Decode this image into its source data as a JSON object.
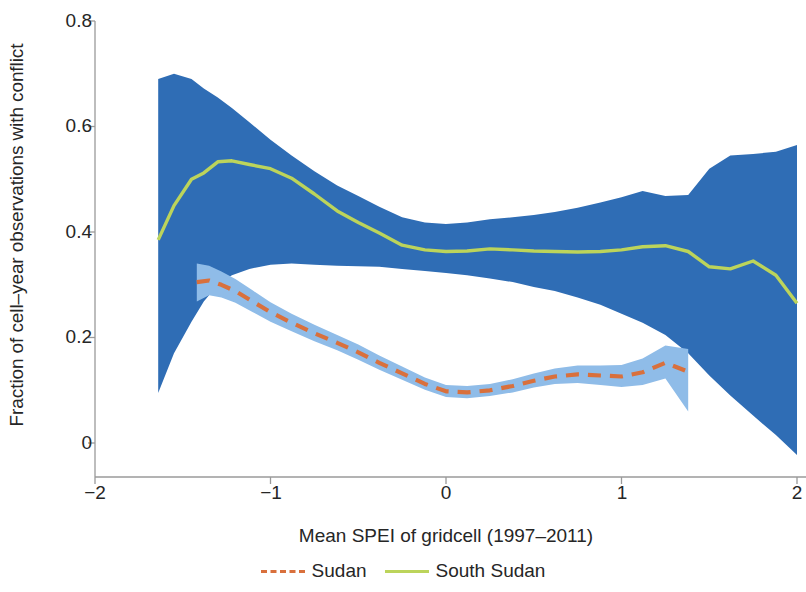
{
  "axes": {
    "ylabel": "Fraction of cell–year observations with conflict",
    "xlabel": "Mean SPEI of gridcell (1997–2011)",
    "y_ticks": [
      "0.8",
      "0.6",
      "0.4",
      "0.2",
      "0"
    ],
    "x_ticks": [
      "−2",
      "−1",
      "0",
      "1",
      "2"
    ]
  },
  "legend": {
    "items": [
      {
        "label": "Sudan",
        "color": "#D9703C",
        "style": "dashed"
      },
      {
        "label": "South Sudan",
        "color": "#BCD45B",
        "style": "solid"
      }
    ]
  },
  "colors": {
    "sudan_line": "#D9703C",
    "sudan_band": "#8FBCE8",
    "south_sudan_line": "#BCD45B",
    "south_sudan_band": "#2F6DB5",
    "axis": "#9a9a9a",
    "text": "#262626"
  },
  "chart_data": {
    "type": "line",
    "title": "",
    "xlabel": "Mean SPEI of gridcell (1997–2011)",
    "ylabel": "Fraction of cell–year observations with conflict",
    "xlim": [
      -2,
      2
    ],
    "ylim": [
      -0.06,
      0.8
    ],
    "grid": false,
    "legend_position": "bottom",
    "x_ticks": [
      -2,
      -1,
      0,
      1,
      2
    ],
    "y_ticks": [
      0,
      0.2,
      0.4,
      0.6,
      0.8
    ],
    "series": [
      {
        "name": "South Sudan",
        "color": "#BCD45B",
        "linestyle": "solid",
        "band_color": "#2F6DB5",
        "x": [
          -1.64,
          -1.55,
          -1.45,
          -1.38,
          -1.3,
          -1.22,
          -1.12,
          -1.0,
          -0.88,
          -0.75,
          -0.62,
          -0.5,
          -0.38,
          -0.25,
          -0.12,
          0.0,
          0.12,
          0.25,
          0.38,
          0.5,
          0.62,
          0.75,
          0.88,
          1.0,
          1.12,
          1.25,
          1.38,
          1.5,
          1.62,
          1.75,
          1.88,
          2.0
        ],
        "y": [
          0.385,
          0.45,
          0.5,
          0.512,
          0.533,
          0.535,
          0.528,
          0.52,
          0.502,
          0.472,
          0.44,
          0.418,
          0.398,
          0.375,
          0.366,
          0.363,
          0.364,
          0.368,
          0.366,
          0.364,
          0.363,
          0.362,
          0.363,
          0.366,
          0.372,
          0.374,
          0.363,
          0.334,
          0.33,
          0.345,
          0.318,
          0.265
        ],
        "y_lower": [
          0.095,
          0.17,
          0.23,
          0.268,
          0.3,
          0.318,
          0.33,
          0.338,
          0.34,
          0.338,
          0.336,
          0.335,
          0.334,
          0.33,
          0.326,
          0.322,
          0.318,
          0.312,
          0.305,
          0.296,
          0.288,
          0.276,
          0.262,
          0.245,
          0.228,
          0.205,
          0.17,
          0.128,
          0.09,
          0.052,
          0.015,
          -0.023
        ],
        "y_upper": [
          0.69,
          0.7,
          0.69,
          0.672,
          0.655,
          0.635,
          0.608,
          0.575,
          0.545,
          0.515,
          0.488,
          0.468,
          0.448,
          0.428,
          0.418,
          0.415,
          0.418,
          0.424,
          0.428,
          0.432,
          0.438,
          0.446,
          0.456,
          0.466,
          0.478,
          0.468,
          0.47,
          0.52,
          0.545,
          0.548,
          0.552,
          0.565
        ]
      },
      {
        "name": "Sudan",
        "color": "#D9703C",
        "linestyle": "dashed",
        "band_color": "#8FBCE8",
        "x": [
          -1.42,
          -1.35,
          -1.28,
          -1.2,
          -1.1,
          -1.0,
          -0.88,
          -0.75,
          -0.62,
          -0.5,
          -0.38,
          -0.25,
          -0.12,
          0.0,
          0.12,
          0.25,
          0.38,
          0.5,
          0.62,
          0.75,
          0.88,
          1.0,
          1.12,
          1.25,
          1.38
        ],
        "y": [
          0.305,
          0.308,
          0.3,
          0.288,
          0.268,
          0.248,
          0.228,
          0.208,
          0.19,
          0.172,
          0.152,
          0.132,
          0.112,
          0.098,
          0.096,
          0.1,
          0.108,
          0.118,
          0.126,
          0.13,
          0.128,
          0.126,
          0.134,
          0.152,
          0.135
        ],
        "y_lower": [
          0.268,
          0.28,
          0.276,
          0.266,
          0.248,
          0.23,
          0.212,
          0.193,
          0.176,
          0.158,
          0.139,
          0.12,
          0.101,
          0.087,
          0.085,
          0.089,
          0.096,
          0.105,
          0.112,
          0.114,
          0.11,
          0.106,
          0.11,
          0.122,
          0.06
        ],
        "y_upper": [
          0.34,
          0.336,
          0.325,
          0.311,
          0.289,
          0.267,
          0.245,
          0.224,
          0.205,
          0.187,
          0.166,
          0.145,
          0.124,
          0.11,
          0.108,
          0.112,
          0.121,
          0.132,
          0.141,
          0.147,
          0.147,
          0.148,
          0.16,
          0.185,
          0.178
        ]
      }
    ]
  }
}
